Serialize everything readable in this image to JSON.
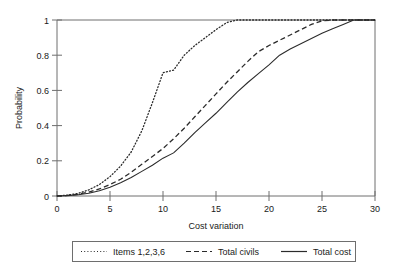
{
  "chart_data": {
    "type": "line",
    "title": "",
    "xlabel": "Cost variation",
    "ylabel": "Probability",
    "xlim": [
      0,
      30
    ],
    "ylim": [
      0,
      1
    ],
    "grid": false,
    "legend_position": "below-axis",
    "xticks": [
      "0",
      "5",
      "10",
      "15",
      "20",
      "25",
      "30"
    ],
    "xtick_values": [
      0,
      5,
      10,
      15,
      20,
      25,
      30
    ],
    "yticks": [
      "0",
      "0.2",
      "0.4",
      "0.6",
      "0.8",
      "1"
    ],
    "ytick_values": [
      0,
      0.2,
      0.4,
      0.6,
      0.8,
      1
    ],
    "x": [
      0,
      1,
      2,
      3,
      4,
      5,
      6,
      7,
      8,
      9,
      10,
      11,
      12,
      13,
      14,
      15,
      16,
      17,
      18,
      19,
      20,
      21,
      22,
      23,
      24,
      25,
      26,
      27,
      28,
      29,
      30
    ],
    "series": [
      {
        "name": "Items 1,2,3,6",
        "style": "dotted",
        "color": "#2b2b2b",
        "values": [
          0.0,
          0.005,
          0.015,
          0.035,
          0.065,
          0.11,
          0.17,
          0.25,
          0.37,
          0.53,
          0.7,
          0.715,
          0.8,
          0.855,
          0.9,
          0.945,
          0.985,
          1.0,
          1.0,
          1.0,
          1.0,
          1.0,
          1.0,
          1.0,
          1.0,
          1.0,
          1.0,
          1.0,
          1.0,
          1.0,
          1.0
        ]
      },
      {
        "name": "Total civils",
        "style": "dashed",
        "color": "#2b2b2b",
        "values": [
          0.0,
          0.003,
          0.01,
          0.022,
          0.04,
          0.065,
          0.095,
          0.135,
          0.18,
          0.225,
          0.27,
          0.325,
          0.385,
          0.45,
          0.515,
          0.58,
          0.645,
          0.705,
          0.765,
          0.82,
          0.855,
          0.885,
          0.915,
          0.945,
          0.975,
          0.995,
          1.0,
          1.0,
          1.0,
          1.0,
          1.0
        ]
      },
      {
        "name": "Total cost",
        "style": "solid",
        "color": "#2b2b2b",
        "values": [
          0.0,
          0.002,
          0.007,
          0.016,
          0.03,
          0.05,
          0.075,
          0.105,
          0.14,
          0.175,
          0.215,
          0.245,
          0.3,
          0.36,
          0.415,
          0.47,
          0.53,
          0.59,
          0.645,
          0.695,
          0.745,
          0.8,
          0.835,
          0.865,
          0.895,
          0.925,
          0.95,
          0.975,
          1.0,
          1.0,
          1.0
        ]
      }
    ]
  },
  "legend": {
    "entries": [
      {
        "label": "Items 1,2,3,6",
        "style": "dotted"
      },
      {
        "label": "Total civils",
        "style": "dashed"
      },
      {
        "label": "Total cost",
        "style": "solid"
      }
    ]
  }
}
